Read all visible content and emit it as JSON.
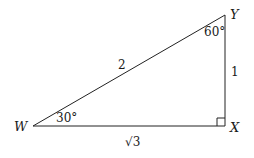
{
  "triangle": {
    "vertices": {
      "W": {
        "label": "W"
      },
      "X": {
        "label": "X"
      },
      "Y": {
        "label": "Y"
      }
    },
    "sides": {
      "WY": "2",
      "XY": "1",
      "WX": "√3"
    },
    "angles": {
      "W": "30°",
      "Y": "60°",
      "X": "right-angle"
    }
  }
}
